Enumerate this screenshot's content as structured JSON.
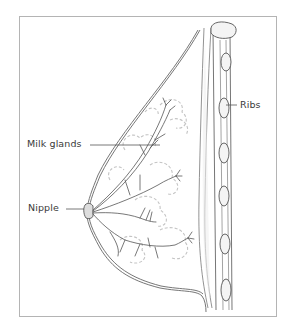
{
  "diagram": {
    "labels": {
      "milk_glands": "Milk glands",
      "nipple": "Nipple",
      "ribs": "Ribs"
    },
    "colors": {
      "line": "#6e6e6e",
      "shade": "#d8d8d8",
      "frame": "#b4b4b4",
      "text": "#3a3a3a"
    }
  }
}
